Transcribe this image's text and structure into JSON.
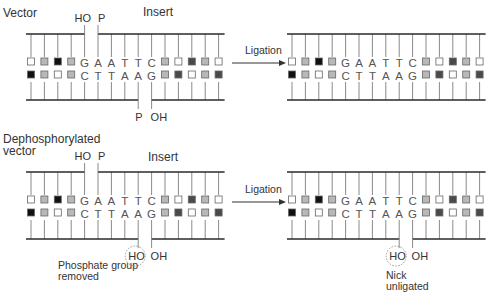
{
  "colors": {
    "backbone": "#2a2a2a",
    "tick": "#8a8a8a",
    "box_white": "#ffffff",
    "box_light": "#b8b8b8",
    "box_dark": "#4a4a4a",
    "box_black": "#111111",
    "box_border": "#666666",
    "circle": "#999999",
    "arrow": "#333333"
  },
  "labels": {
    "vector": "Vector",
    "dephosphorylated_line1": "Dephosphorylated",
    "dephosphorylated_line2": "vector",
    "insert_top": "Insert",
    "insert_bottom": "Insert",
    "ligation_top": "Ligation",
    "ligation_bottom": "Ligation",
    "phosphate_line1": "Phosphate group",
    "phosphate_line2": "removed",
    "nick_line1": "Nick",
    "nick_line2": "unligated"
  },
  "sequence": {
    "top_strand": [
      "white",
      "light",
      "black",
      "light",
      "G",
      "A",
      "A",
      "T",
      "T",
      "C",
      "light",
      "white",
      "dark",
      "light",
      "white"
    ],
    "bottom_strand": [
      "black",
      "light",
      "white",
      "light",
      "C",
      "T",
      "T",
      "A",
      "A",
      "G",
      "light",
      "dark",
      "white",
      "light",
      "dark"
    ]
  },
  "panels": [
    {
      "id": "vector-before",
      "x0": 31,
      "y_top": 34,
      "y_bot": 100,
      "top_gap": true,
      "bottom_gap": true,
      "top_end_labels": {
        "left": "HO",
        "right": "P"
      },
      "bottom_end_labels": {
        "left": "P",
        "right": "OH"
      },
      "circle": false
    },
    {
      "id": "vector-after",
      "x0": 292,
      "y_top": 34,
      "y_bot": 100,
      "top_gap": false,
      "bottom_gap": false
    },
    {
      "id": "dephos-before",
      "x0": 31,
      "y_top": 172,
      "y_bot": 239,
      "top_gap": true,
      "bottom_gap": true,
      "top_end_labels": {
        "left": "HO",
        "right": "P"
      },
      "bottom_end_labels": {
        "left": "HO",
        "right": "OH"
      },
      "circle": true
    },
    {
      "id": "dephos-after",
      "x0": 292,
      "y_top": 172,
      "y_bot": 239,
      "top_gap": false,
      "bottom_gap": true,
      "bottom_end_labels": {
        "left": "HO",
        "right": "OH"
      },
      "circle": true
    }
  ]
}
